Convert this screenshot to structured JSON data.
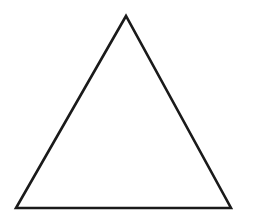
{
  "diagram": {
    "shape": "triangle",
    "fill": "#ffffff",
    "stroke": "#1a1a1a",
    "stroke_width": 2.6,
    "vertices": {
      "apex": [
        126,
        16
      ],
      "bottom_left": [
        16,
        208
      ],
      "bottom_right": [
        231,
        208
      ]
    },
    "points": "126,16 16,208 231,208"
  }
}
